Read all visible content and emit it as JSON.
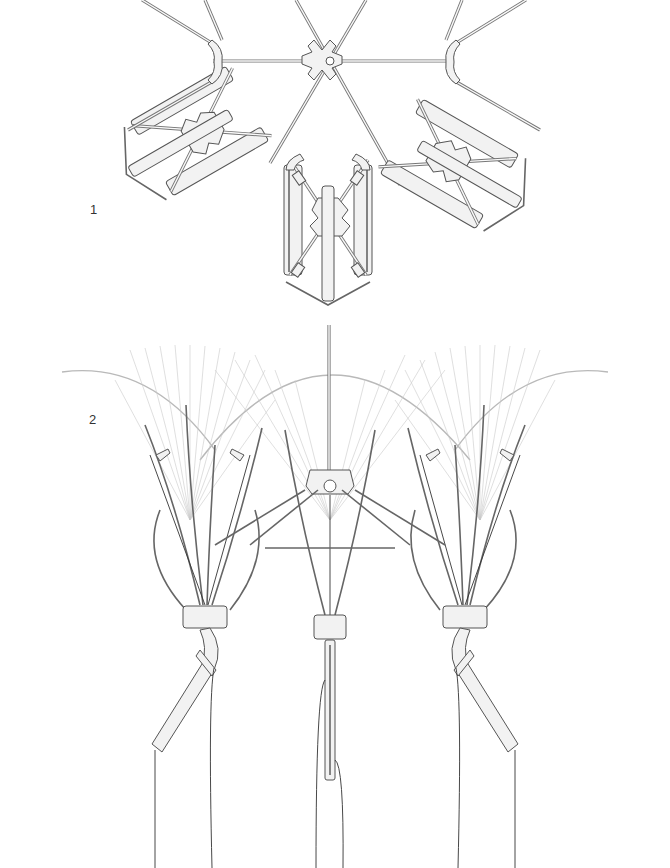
{
  "figure": {
    "type": "technical line drawing",
    "labels": [
      {
        "id": "1",
        "text": "1",
        "describes": "top view of folding umbrella-like mechanism, three arm hubs around a six-spoke central hub"
      },
      {
        "id": "2",
        "text": "2",
        "describes": "front view of mechanism with ribs fanning out, showing motion sweep, handles and strings hanging below"
      }
    ],
    "colors": {
      "background": "#ffffff",
      "line": "#555555",
      "fill": "#f2f2f2",
      "ghost_sweep": "#c9c9c9",
      "string": "#333333"
    }
  }
}
